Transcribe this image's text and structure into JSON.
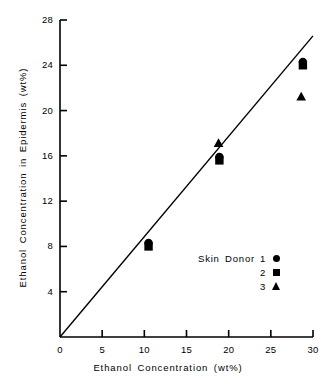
{
  "chart_data": {
    "type": "scatter",
    "title": "",
    "xlabel": "Ethanol Concentration  (wt%)",
    "ylabel": "Ethanol  Concentration  in  Epidermis  (wt%)",
    "xlim": [
      0,
      30
    ],
    "ylim": [
      0,
      28
    ],
    "xticks": [
      0,
      5,
      10,
      15,
      20,
      25,
      30
    ],
    "yticks": [
      4,
      8,
      12,
      16,
      20,
      24,
      28
    ],
    "xtick_labels": [
      "0",
      "5",
      "10",
      "15",
      "20",
      "25",
      "30"
    ],
    "ytick_labels": [
      "4",
      "8",
      "12",
      "16",
      "20",
      "24",
      "28"
    ],
    "grid": false,
    "legend_position": "inside-lower-right",
    "legend_title": "Skin  Donor",
    "reference_line": {
      "label": "unity line",
      "x": [
        0,
        30
      ],
      "y": [
        0,
        26.6
      ]
    },
    "series": [
      {
        "name": "1",
        "marker": "circle",
        "points": [
          {
            "x": 10.5,
            "y": 8.3
          },
          {
            "x": 18.9,
            "y": 15.9
          },
          {
            "x": 28.8,
            "y": 24.3
          }
        ]
      },
      {
        "name": "2",
        "marker": "square",
        "points": [
          {
            "x": 10.5,
            "y": 8.0
          },
          {
            "x": 18.9,
            "y": 15.6
          },
          {
            "x": 28.8,
            "y": 24.0
          }
        ]
      },
      {
        "name": "3",
        "marker": "triangle",
        "points": [
          {
            "x": 18.8,
            "y": 17.1
          },
          {
            "x": 28.6,
            "y": 21.2
          }
        ]
      }
    ]
  },
  "legend": {
    "title": "Skin  Donor",
    "entries": [
      {
        "label": "1",
        "marker": "circle"
      },
      {
        "label": "2",
        "marker": "square"
      },
      {
        "label": "3",
        "marker": "triangle"
      }
    ]
  },
  "axes": {
    "x_title": "Ethanol  Concentration  (wt%)",
    "y_title": "Ethanol  Concentration  in  Epidermis  (wt%)"
  }
}
